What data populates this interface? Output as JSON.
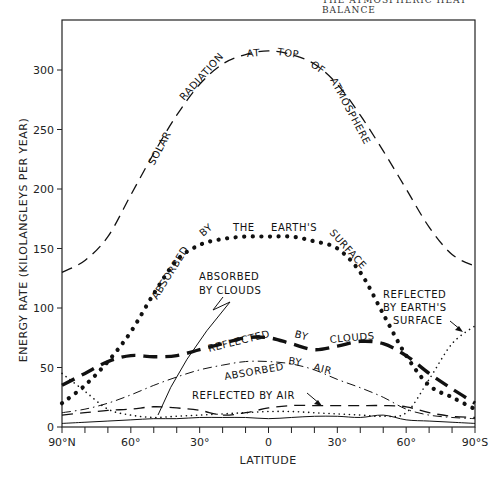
{
  "page": {
    "running_head": "THE ATMOSPHERIC HEAT BALANCE"
  },
  "chart_data": {
    "type": "line",
    "title": "",
    "xlabel": "LATITUDE",
    "ylabel": "ENERGY RATE (KILOLANGLEYS PER YEAR)",
    "x_tick_labels": [
      "90°N",
      "60°",
      "30°",
      "0",
      "30°",
      "60°",
      "90°S"
    ],
    "x": [
      -90,
      -80,
      -70,
      -60,
      -50,
      -40,
      -30,
      -20,
      -10,
      0,
      10,
      20,
      30,
      40,
      50,
      60,
      70,
      80,
      90
    ],
    "y_ticks": [
      0,
      50,
      100,
      150,
      200,
      250,
      300
    ],
    "ylim": [
      0,
      340
    ],
    "xlim": [
      -90,
      90
    ],
    "grid": false,
    "legend": "inline annotations",
    "series": [
      {
        "name": "Solar radiation at top of atmosphere",
        "style": "dashed",
        "values": [
          130,
          140,
          160,
          195,
          230,
          262,
          288,
          305,
          313,
          316,
          313,
          305,
          288,
          262,
          232,
          200,
          168,
          145,
          135
        ]
      },
      {
        "name": "Absorbed by the Earth's surface",
        "style": "heavy dotted",
        "values": [
          20,
          35,
          55,
          80,
          112,
          140,
          153,
          158,
          160,
          160,
          160,
          156,
          150,
          130,
          95,
          60,
          35,
          25,
          15
        ]
      },
      {
        "name": "Reflected by clouds",
        "style": "heavy dashed",
        "values": [
          35,
          45,
          55,
          60,
          59,
          60,
          65,
          70,
          75,
          75,
          70,
          65,
          68,
          72,
          70,
          60,
          45,
          32,
          20
        ]
      },
      {
        "name": "Absorbed by air",
        "style": "dash-dot",
        "values": [
          12,
          15,
          20,
          27,
          35,
          42,
          48,
          52,
          55,
          55,
          53,
          48,
          40,
          33,
          25,
          15,
          10,
          8,
          7
        ]
      },
      {
        "name": "Reflected by air",
        "style": "dashed",
        "values": [
          10,
          12,
          14,
          15,
          17,
          16,
          14,
          10,
          12,
          16,
          18,
          18,
          18,
          18,
          18,
          17,
          12,
          9,
          8
        ]
      },
      {
        "name": "Reflected by Earth's surface",
        "style": "light dotted",
        "values": [
          45,
          30,
          15,
          10,
          8,
          9,
          10,
          11,
          12,
          13,
          13,
          12,
          11,
          10,
          9,
          12,
          40,
          70,
          85
        ]
      },
      {
        "name": "Absorbed by clouds",
        "style": "solid thin",
        "values": [
          3,
          4,
          5,
          6,
          7,
          7,
          8,
          8,
          8,
          7,
          8,
          9,
          9,
          8,
          10,
          6,
          5,
          4,
          3
        ]
      }
    ],
    "annotations": [
      {
        "text": "SOLAR RADIATION AT TOP OF ATMOSPHERE",
        "along": "Solar radiation at top of atmosphere"
      },
      {
        "text": "ABSORBED BY THE EARTH'S SURFACE",
        "along": "Absorbed by the Earth's surface"
      },
      {
        "text": "ABSORBED BY CLOUDS",
        "pointer": "lightning arrow to solid curve near 50°N"
      },
      {
        "text": "REFLECTED BY CLOUDS",
        "along": "Reflected by clouds"
      },
      {
        "text": "ABSORBED BY AIR",
        "along": "Absorbed by air"
      },
      {
        "text": "REFLECTED BY AIR",
        "pointer": "arrow to dashed curve near 15°S"
      },
      {
        "text": "REFLECTED BY EARTH'S SURFACE",
        "pointer": "arrow to dotted curve near 85°S"
      }
    ]
  },
  "labels": {
    "solar": [
      "SOLAR",
      "RADIATION",
      "AT",
      "TOP",
      "OF",
      "ATMOSPHERE"
    ],
    "surface": [
      "ABSORBED",
      "BY",
      "THE",
      "EARTH'S",
      "SURFACE"
    ],
    "abs_clouds": [
      "ABSORBED",
      "BY CLOUDS"
    ],
    "refl_clouds": [
      "REFLECTED",
      "BY",
      "CLOUDS"
    ],
    "abs_air": [
      "ABSORBED",
      "BY",
      "AIR"
    ],
    "refl_air": "REFLECTED BY AIR",
    "refl_surface": [
      "REFLECTED",
      "BY EARTH'S",
      "SURFACE"
    ]
  }
}
